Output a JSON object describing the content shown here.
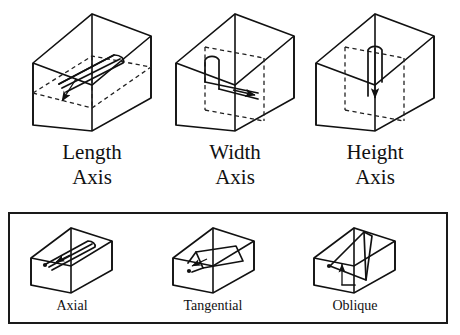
{
  "figure": {
    "background_color": "#ffffff",
    "line_color": "#111111",
    "dashed_color": "#222222"
  },
  "top_row": {
    "items": [
      {
        "id": "length-axis",
        "label_line1": "Length",
        "label_line2": "Axis",
        "icon": "box-with-length-axis-rotation-arrow",
        "box_type": "tall-box",
        "arrow_direction": "along-length-diagonal"
      },
      {
        "id": "width-axis",
        "label_line1": "Width",
        "label_line2": "Axis",
        "icon": "box-with-width-axis-rotation-arrow",
        "box_type": "tall-box",
        "arrow_direction": "along-width-diagonal"
      },
      {
        "id": "height-axis",
        "label_line1": "Height",
        "label_line2": "Axis",
        "icon": "box-with-height-axis-rotation-arrow",
        "box_type": "tall-box",
        "arrow_direction": "vertical-down"
      }
    ]
  },
  "bottom_panel": {
    "border_color": "#1a1a1a",
    "items": [
      {
        "id": "axial",
        "label": "Axial",
        "icon": "flat-box-with-axial-crack",
        "box_type": "flat-box"
      },
      {
        "id": "tangential",
        "label": "Tangential",
        "icon": "flat-box-with-tangential-crack",
        "box_type": "flat-box"
      },
      {
        "id": "oblique",
        "label": "Oblique",
        "icon": "flat-box-with-oblique-crack",
        "box_type": "flat-box"
      }
    ]
  }
}
